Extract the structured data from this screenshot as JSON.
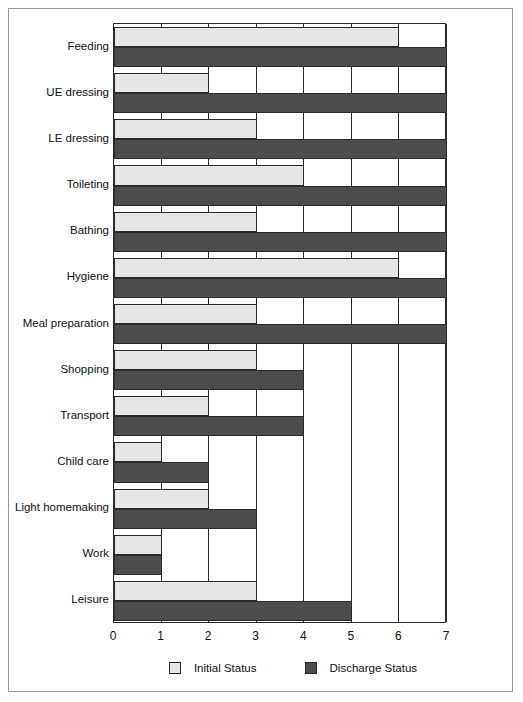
{
  "chart_data": {
    "type": "bar",
    "orientation": "horizontal",
    "title": "",
    "subtitle": "",
    "xlabel": "",
    "ylabel": "",
    "xlim": [
      0,
      7
    ],
    "xticks": [
      "0",
      "1",
      "2",
      "3",
      "4",
      "5",
      "6",
      "7"
    ],
    "grid": true,
    "grid_axis": "x",
    "legend_position": "bottom",
    "categories": [
      "Feeding",
      "UE dressing",
      "LE dressing",
      "Toileting",
      "Bathing",
      "Hygiene",
      "Meal preparation",
      "Shopping",
      "Transport",
      "Child care",
      "Light homemaking",
      "Work",
      "Leisure"
    ],
    "series": [
      {
        "name": "Initial Status",
        "color": "#e6e6e6",
        "values": [
          6,
          2,
          3,
          4,
          3,
          6,
          3,
          3,
          2,
          1,
          2,
          1,
          3
        ]
      },
      {
        "name": "Discharge Status",
        "color": "#4d4d4d",
        "values": [
          7,
          7,
          7,
          7,
          7,
          7,
          7,
          4,
          4,
          2,
          3,
          1,
          5
        ]
      }
    ]
  },
  "colors": {
    "initial": "#e6e6e6",
    "discharge": "#4d4d4d",
    "outline": "#2b2b2b",
    "frame": "#9a9a9a",
    "text": "#111111"
  }
}
